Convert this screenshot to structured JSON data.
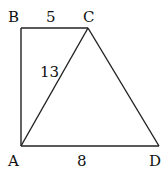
{
  "diagram": {
    "type": "geometry-trapezoid",
    "points": {
      "A": {
        "label": "A",
        "x": 21,
        "y": 146
      },
      "B": {
        "label": "B",
        "x": 21,
        "y": 28
      },
      "C": {
        "label": "C",
        "x": 88,
        "y": 28
      },
      "D": {
        "label": "D",
        "x": 159,
        "y": 146
      }
    },
    "segments": [
      {
        "from": "A",
        "to": "B"
      },
      {
        "from": "B",
        "to": "C"
      },
      {
        "from": "C",
        "to": "D"
      },
      {
        "from": "A",
        "to": "D"
      },
      {
        "from": "A",
        "to": "C"
      }
    ],
    "measurements": {
      "BC": "5",
      "AC": "13",
      "AD": "8"
    },
    "line_color": "#222222"
  }
}
